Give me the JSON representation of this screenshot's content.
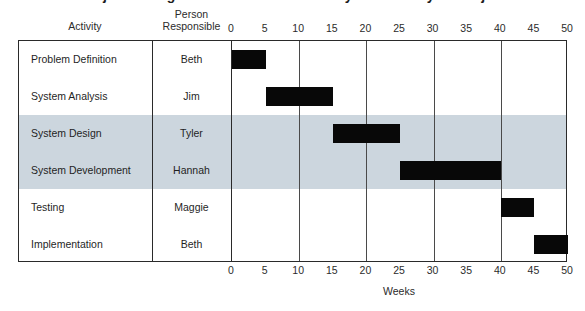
{
  "title": "Project Management Gantt Chart for a Systems Analysis Project",
  "headers": {
    "activity": "Activity",
    "person_line1": "Person",
    "person_line2": "Responsible"
  },
  "axis": {
    "label": "Weeks",
    "ticks": [
      "0",
      "5",
      "10",
      "15",
      "20",
      "25",
      "30",
      "35",
      "40",
      "45",
      "50"
    ]
  },
  "rows": [
    {
      "activity": "Problem Definition",
      "person": "Beth",
      "start": 0,
      "end": 5,
      "shaded": false
    },
    {
      "activity": "System Analysis",
      "person": "Jim",
      "start": 5,
      "end": 15,
      "shaded": false
    },
    {
      "activity": "System Design",
      "person": "Tyler",
      "start": 15,
      "end": 25,
      "shaded": true
    },
    {
      "activity": "System Development",
      "person": "Hannah",
      "start": 25,
      "end": 40,
      "shaded": true
    },
    {
      "activity": "Testing",
      "person": "Maggie",
      "start": 40,
      "end": 45,
      "shaded": false
    },
    {
      "activity": "Implementation",
      "person": "Beth",
      "start": 45,
      "end": 50,
      "shaded": false
    }
  ],
  "colors": {
    "bar": "#080808",
    "shade": "#ccd6de",
    "border": "#2a2a2a",
    "text": "#1f1f1f"
  },
  "chart_data": {
    "type": "bar",
    "title": "Project Management Gantt Chart for a Systems Analysis Project",
    "xlabel": "Weeks",
    "ylabel": "Activity",
    "xlim": [
      0,
      50
    ],
    "xticks": [
      0,
      5,
      10,
      15,
      20,
      25,
      30,
      35,
      40,
      45,
      50
    ],
    "gridlines_at": [
      0,
      10,
      20,
      30,
      40,
      50
    ],
    "grid": true,
    "legend": "none",
    "orientation": "horizontal",
    "categories": [
      "Problem Definition",
      "System Analysis",
      "System Design",
      "System Development",
      "Testing",
      "Implementation"
    ],
    "series": [
      {
        "name": "Task duration (weeks)",
        "bars": [
          {
            "category": "Problem Definition",
            "person": "Beth",
            "start": 0,
            "end": 5,
            "duration": 5
          },
          {
            "category": "System Analysis",
            "person": "Jim",
            "start": 5,
            "end": 15,
            "duration": 10
          },
          {
            "category": "System Design",
            "person": "Tyler",
            "start": 15,
            "end": 25,
            "duration": 10
          },
          {
            "category": "System Development",
            "person": "Hannah",
            "start": 25,
            "end": 40,
            "duration": 15
          },
          {
            "category": "Testing",
            "person": "Maggie",
            "start": 40,
            "end": 45,
            "duration": 5
          },
          {
            "category": "Implementation",
            "person": "Beth",
            "start": 45,
            "end": 50,
            "duration": 5
          }
        ]
      }
    ]
  }
}
